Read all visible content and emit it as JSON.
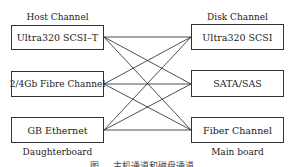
{
  "diagram": {
    "left_title": "Host Channel",
    "right_title": "Disk Channel",
    "left_footer": "Daughterboard",
    "right_footer": "Main board",
    "left_nodes": [
      {
        "label": "Ultra320 SCSI–T"
      },
      {
        "label": "2/4Gb Fibre Channel"
      },
      {
        "label": "GB Ethernet"
      }
    ],
    "right_nodes": [
      {
        "label": "Ultra320 SCSI"
      },
      {
        "label": "SATA/SAS"
      },
      {
        "label": "Fiber Channel"
      }
    ],
    "edges": "fully connected: every host channel node links to every disk channel node",
    "caption": "图 … 主机通道和磁盘通道…"
  }
}
